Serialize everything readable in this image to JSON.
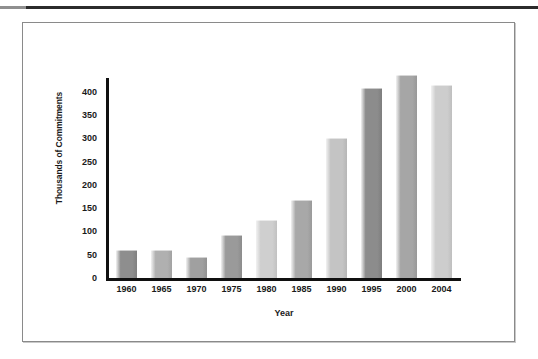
{
  "figure": {
    "frame_border_color": "#8a8a8a",
    "background": "#ffffff",
    "axis_color": "#101010"
  },
  "chart_data": {
    "type": "bar",
    "title": "",
    "xlabel": "Year",
    "ylabel": "Thousands of Commitments",
    "categories": [
      "1960",
      "1965",
      "1970",
      "1975",
      "1980",
      "1985",
      "1990",
      "1995",
      "2000",
      "2004"
    ],
    "values": [
      57,
      57,
      44,
      90,
      122,
      165,
      298,
      405,
      433,
      412
    ],
    "ylim": [
      0,
      440
    ],
    "yticks": [
      0,
      50,
      100,
      150,
      200,
      250,
      300,
      350,
      400
    ],
    "ytick_labels": [
      "0",
      "50",
      "100",
      "150",
      "200",
      "250",
      "300",
      "350",
      "400"
    ],
    "grid": false,
    "legend": "none",
    "bar_colors": [
      "#8e8e8e",
      "#b0b0b0",
      "#a0a0a0",
      "#9a9a9a",
      "#cfcfcf",
      "#a8a8a8",
      "#c4c4c4",
      "#8c8c8c",
      "#a6a6a6",
      "#cdcdcd"
    ]
  }
}
